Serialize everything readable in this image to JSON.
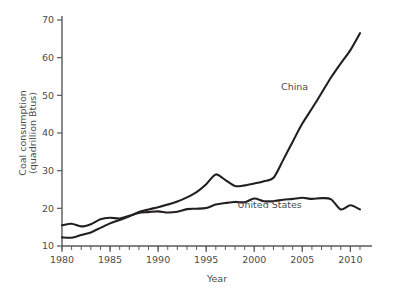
{
  "chart_data": {
    "type": "line",
    "title": "",
    "xlabel": "Year",
    "ylabel": "Coal consumption (quadrillion Btus)",
    "ylabel_line1": "Coal consumption",
    "ylabel_line2": "(quadrillion Btus)",
    "xlim": [
      1980,
      2011
    ],
    "ylim": [
      10,
      70
    ],
    "yticks": [
      10,
      20,
      30,
      40,
      50,
      60,
      70
    ],
    "ytick_labels": [
      "10",
      "20",
      "30",
      "40",
      "50",
      "60",
      "70"
    ],
    "xticks": [
      1980,
      1985,
      1990,
      1995,
      2000,
      2005,
      2010
    ],
    "xtick_labels": [
      "1980",
      "1985",
      "1990",
      "1995",
      "2000",
      "2005",
      "2010"
    ],
    "x_minor_tick_step": 1,
    "grid": false,
    "legend_position": "inline-annotation",
    "line_color": "#231f20",
    "axis_color": "#58595b",
    "text_color": "#4b4c4e",
    "background_color": "#ffffff",
    "x": [
      1980,
      1981,
      1982,
      1983,
      1984,
      1985,
      1986,
      1987,
      1988,
      1989,
      1990,
      1991,
      1992,
      1993,
      1994,
      1995,
      1996,
      1997,
      1998,
      1999,
      2000,
      2001,
      2002,
      2003,
      2004,
      2005,
      2006,
      2007,
      2008,
      2009,
      2010,
      2011
    ],
    "series": [
      {
        "name": "China",
        "label": "China",
        "label_x": 2004.2,
        "label_y": 51.5,
        "values": [
          12.3,
          12.2,
          12.9,
          13.6,
          14.8,
          16.0,
          16.9,
          17.9,
          19.0,
          19.7,
          20.3,
          21.0,
          21.8,
          22.9,
          24.3,
          26.4,
          29.0,
          27.5,
          25.9,
          26.1,
          26.6,
          27.2,
          28.1,
          32.8,
          37.7,
          42.5,
          46.5,
          50.6,
          54.8,
          58.5,
          62.0,
          66.5
        ]
      },
      {
        "name": "United States",
        "label": "United States",
        "label_x": 2001.6,
        "label_y": 20.2,
        "values": [
          15.5,
          15.9,
          15.2,
          15.8,
          17.1,
          17.5,
          17.3,
          18.0,
          18.8,
          19.0,
          19.2,
          18.9,
          19.1,
          19.8,
          19.9,
          20.1,
          21.0,
          21.4,
          21.7,
          21.6,
          22.6,
          21.9,
          21.9,
          22.3,
          22.5,
          22.8,
          22.5,
          22.7,
          22.4,
          19.7,
          20.8,
          19.7
        ]
      }
    ],
    "annotations": [
      {
        "text": "China",
        "x": 2004.2,
        "y": 51.5
      },
      {
        "text": "United States",
        "x": 2001.6,
        "y": 20.2
      }
    ]
  }
}
